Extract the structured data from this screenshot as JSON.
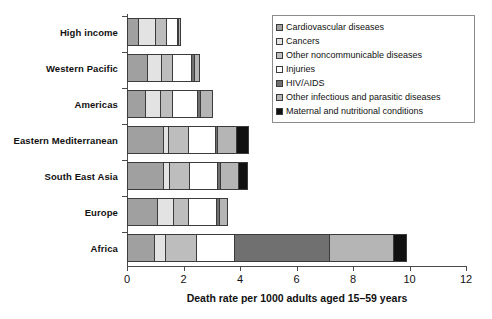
{
  "chart_data": {
    "type": "bar",
    "orientation": "horizontal",
    "stacked": true,
    "title": "",
    "xlabel": "Death rate per 1000 adults aged 15–59 years",
    "ylabel": "",
    "xlim": [
      0,
      12
    ],
    "xticks": [
      0,
      2,
      4,
      6,
      8,
      10,
      12
    ],
    "xtick_labels": [
      "0",
      "2",
      "4",
      "6",
      "8",
      "10",
      "12"
    ],
    "grid": false,
    "legend_position": "top-right",
    "categories": [
      "High income",
      "Western Pacific",
      "Americas",
      "Eastern Mediterranean",
      "South East Asia",
      "Europe",
      "Africa"
    ],
    "series": [
      {
        "name": "Cardiovascular diseases",
        "color": "#a0a0a0",
        "values": [
          0.42,
          0.72,
          0.66,
          1.3,
          1.3,
          1.1,
          0.95
        ]
      },
      {
        "name": "Cancers",
        "color": "#e3e3e3",
        "values": [
          0.62,
          0.5,
          0.52,
          0.18,
          0.22,
          0.55,
          0.4
        ]
      },
      {
        "name": "Other noncommunicable diseases",
        "color": "#bdbdbd",
        "values": [
          0.4,
          0.4,
          0.45,
          0.7,
          0.72,
          0.55,
          1.1
        ]
      },
      {
        "name": "Injuries",
        "color": "#ffffff",
        "values": [
          0.4,
          0.72,
          0.9,
          1.0,
          1.0,
          1.0,
          1.35
        ]
      },
      {
        "name": "HIV/AIDS",
        "color": "#707070",
        "values": [
          0.04,
          0.1,
          0.12,
          0.05,
          0.12,
          0.12,
          3.4
        ]
      },
      {
        "name": "Other infectious and parasitic diseases",
        "color": "#b5b5b5",
        "values": [
          0.04,
          0.16,
          0.4,
          0.7,
          0.62,
          0.25,
          2.3
        ]
      },
      {
        "name": "Maternal and nutritional conditions",
        "color": "#111111",
        "values": [
          0.0,
          0.0,
          0.0,
          0.4,
          0.32,
          0.0,
          0.4
        ]
      }
    ],
    "totals": [
      1.92,
      2.6,
      3.05,
      4.33,
      4.3,
      3.57,
      9.9
    ]
  }
}
